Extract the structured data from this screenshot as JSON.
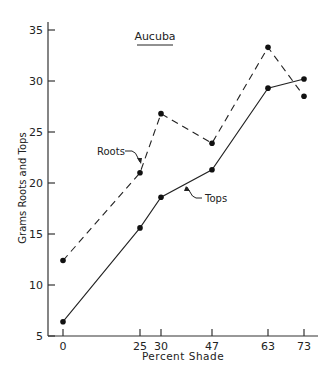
{
  "chart_data": {
    "type": "line",
    "title": "Aucuba",
    "xlabel": "Percent Shade",
    "ylabel": "Grams Roots and Tops",
    "x": [
      0,
      25,
      30,
      47,
      63,
      73
    ],
    "x_tick_labels": [
      "0",
      "25",
      "30",
      "47",
      "63",
      "73"
    ],
    "y_ticks": [
      5,
      10,
      15,
      20,
      25,
      30,
      35
    ],
    "y_tick_labels": [
      "5",
      "10",
      "15",
      "20",
      "25",
      "30",
      "35"
    ],
    "ylim": [
      5,
      35
    ],
    "xlim": [
      -5,
      78
    ],
    "grid": false,
    "legend": "inline annotations",
    "series": [
      {
        "name": "Roots",
        "style": "dashed",
        "values": [
          12.4,
          21.0,
          26.8,
          23.9,
          33.3,
          28.5
        ]
      },
      {
        "name": "Tops",
        "style": "solid",
        "values": [
          6.4,
          15.6,
          18.6,
          21.3,
          29.3,
          30.2
        ]
      }
    ],
    "annotations": [
      {
        "text": "Roots",
        "points_to_series": "Roots"
      },
      {
        "text": "Tops",
        "points_to_series": "Tops"
      }
    ]
  },
  "colors": {
    "ink": "#222222",
    "background": "#ffffff"
  }
}
